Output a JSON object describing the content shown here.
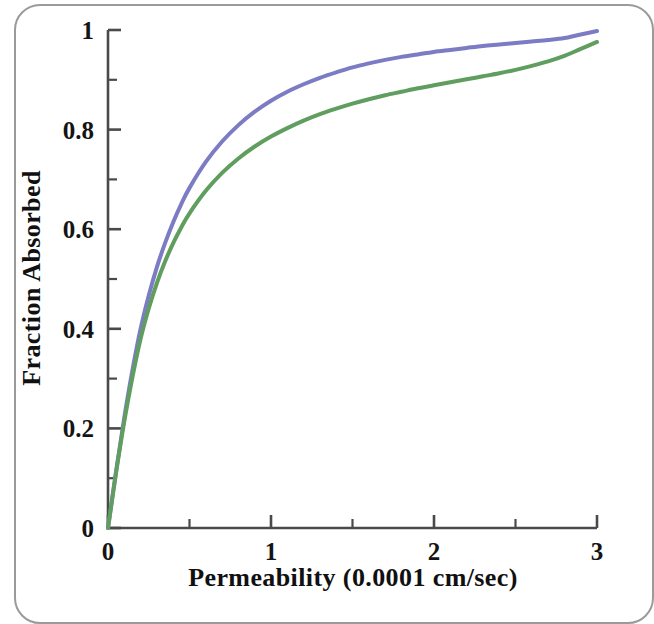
{
  "figure": {
    "background_color": "#ffffff",
    "frame_color": "#9a9a9a"
  },
  "chart_data": {
    "type": "line",
    "title": "",
    "subtitle": "",
    "xlabel": "Permeability (0.0001 cm/sec)",
    "ylabel": "Fraction Absorbed",
    "xlim": [
      0,
      3
    ],
    "ylim": [
      0,
      1
    ],
    "xticks": [
      0,
      1,
      2,
      3
    ],
    "xtick_labels": [
      "0",
      "1",
      "2",
      "3"
    ],
    "xminor_ticks": [
      0.25,
      0.5,
      0.75,
      1.25,
      1.5,
      1.75,
      2.25,
      2.5,
      2.75
    ],
    "yticks": [
      0,
      0.2,
      0.4,
      0.6,
      0.8,
      1
    ],
    "ytick_labels": [
      "0",
      "0.2",
      "0.4",
      "0.6",
      "0.8",
      "1"
    ],
    "yminor_ticks": [
      0.1,
      0.3,
      0.5,
      0.7,
      0.9
    ],
    "grid": false,
    "legend": false,
    "legend_position": "none",
    "axis_color": "#4a4a4a",
    "annotations": [],
    "x": [
      0,
      0.05,
      0.1,
      0.15,
      0.2,
      0.25,
      0.3,
      0.35,
      0.4,
      0.45,
      0.5,
      0.6,
      0.7,
      0.8,
      0.9,
      1.0,
      1.1,
      1.2,
      1.3,
      1.4,
      1.5,
      1.6,
      1.7,
      1.8,
      1.9,
      2.0,
      2.1,
      2.2,
      2.3,
      2.4,
      2.5,
      2.6,
      2.7,
      2.8,
      2.9,
      3.0
    ],
    "series": [
      {
        "name": "upper-curve",
        "color": "#7b7cc4",
        "linewidth": 4,
        "values": [
          0,
          0.115,
          0.222,
          0.317,
          0.4,
          0.467,
          0.524,
          0.572,
          0.614,
          0.651,
          0.683,
          0.735,
          0.776,
          0.809,
          0.836,
          0.858,
          0.876,
          0.891,
          0.904,
          0.915,
          0.925,
          0.933,
          0.94,
          0.946,
          0.951,
          0.956,
          0.96,
          0.964,
          0.968,
          0.971,
          0.974,
          0.977,
          0.98,
          0.984,
          0.991,
          0.998
        ]
      },
      {
        "name": "lower-curve",
        "color": "#5f9e5f",
        "linewidth": 4,
        "values": [
          0,
          0.112,
          0.214,
          0.303,
          0.38,
          0.441,
          0.492,
          0.535,
          0.572,
          0.604,
          0.632,
          0.677,
          0.713,
          0.742,
          0.766,
          0.786,
          0.803,
          0.818,
          0.831,
          0.842,
          0.852,
          0.861,
          0.869,
          0.876,
          0.883,
          0.889,
          0.895,
          0.901,
          0.907,
          0.913,
          0.92,
          0.928,
          0.937,
          0.948,
          0.962,
          0.976
        ]
      }
    ]
  }
}
